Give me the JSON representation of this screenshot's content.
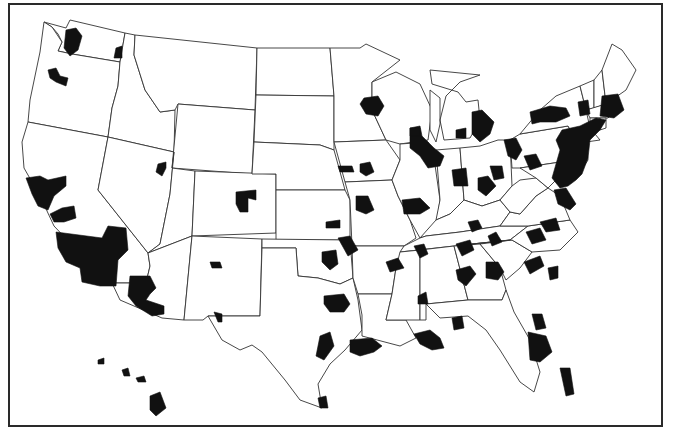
{
  "map": {
    "subject": "Contiguous United States, Alaska excluded, Hawaii inset, with shaded metropolitan areas",
    "colors": {
      "background": "#ffffff",
      "state_fill": "#ffffff",
      "state_border": "#333333",
      "metro_fill": "#111111",
      "frame": "#2a2a2a"
    },
    "legend": null,
    "title": null,
    "states": [
      {
        "id": "WA",
        "d": "M44,22 L52,27 L58,34 L62,42 L58,51 L72,54 L120,62 L125,33 L70,20 L66,28 Z"
      },
      {
        "id": "OR",
        "d": "M44,22 L40,52 L30,100 L28,122 L108,137 L112,108 L118,86 L120,62 L72,54 L58,51 L62,42 L52,27 Z"
      },
      {
        "id": "CA",
        "d": "M28,122 L108,137 L98,190 L148,253 L150,266 L146,283 L112,283 L96,262 L74,247 L54,226 L40,196 L24,168 L22,142 Z"
      },
      {
        "id": "ID",
        "d": "M125,33 L135,35 L134,55 L145,90 L160,112 L175,110 L174,152 L108,137 L112,108 L118,86 L120,62 Z"
      },
      {
        "id": "NV",
        "d": "M108,137 L174,152 L170,194 L160,244 L148,253 L98,190 Z"
      },
      {
        "id": "MT",
        "d": "M135,35 L257,48 L255,110 L178,104 L175,110 L160,112 L145,90 L134,55 Z"
      },
      {
        "id": "WY",
        "d": "M178,104 L255,110 L252,174 L172,168 Z"
      },
      {
        "id": "UT",
        "d": "M174,152 L172,168 L195,171 L192,236 L148,253 L160,244 L170,194 Z"
      },
      {
        "id": "AZ",
        "d": "M148,253 L192,236 L184,320 L162,318 L120,300 L112,283 L146,283 L150,266 Z"
      },
      {
        "id": "CO",
        "d": "M195,171 L276,174 L276,233 L192,236 Z"
      },
      {
        "id": "NM",
        "d": "M192,236 L262,239 L260,316 L208,316 L203,320 L184,320 Z"
      },
      {
        "id": "ND",
        "d": "M257,48 L330,48 L334,96 L256,95 Z"
      },
      {
        "id": "SD",
        "d": "M256,95 L334,96 L334,150 L320,145 L254,142 Z"
      },
      {
        "id": "NE",
        "d": "M254,142 L320,145 L334,150 L345,190 L276,190 L276,174 L252,174 Z"
      },
      {
        "id": "KS",
        "d": "M276,190 L345,190 L350,200 L350,240 L276,240 Z"
      },
      {
        "id": "OK",
        "d": "M262,239 L350,240 L353,278 L340,284 L318,278 L298,276 L296,248 L262,248 Z"
      },
      {
        "id": "TX",
        "d": "M262,248 L296,248 L298,276 L318,278 L340,284 L353,278 L358,300 L362,330 L345,350 L330,364 L318,384 L322,408 L300,400 L285,380 L262,352 L252,345 L240,350 L222,340 L208,316 L260,316 Z"
      },
      {
        "id": "MN",
        "d": "M330,48 L360,48 L366,44 L400,60 L372,82 L372,110 L386,140 L334,142 L334,96 Z"
      },
      {
        "id": "IA",
        "d": "M334,142 L386,140 L400,160 L392,180 L345,182 Z"
      },
      {
        "id": "MO",
        "d": "M345,182 L392,180 L398,196 L410,220 L416,238 L404,246 L352,246 L350,200 Z"
      },
      {
        "id": "AR",
        "d": "M352,246 L404,246 L396,268 L392,294 L358,294 L353,278 Z"
      },
      {
        "id": "LA",
        "d": "M358,294 L392,294 L386,320 L406,320 L416,338 L400,346 L362,336 L362,315 Z"
      },
      {
        "id": "WI",
        "d": "M372,82 L396,72 L420,84 L432,110 L428,140 L400,144 L386,140 L372,110 Z"
      },
      {
        "id": "IL",
        "d": "M400,144 L428,142 L434,158 L440,200 L436,228 L420,238 L410,220 L398,196 L392,180 L400,160 Z"
      },
      {
        "id": "MI",
        "d": "M430,70 L480,75 L460,82 L446,96 L440,120 L444,140 L470,138 L480,120 L478,100 L466,102 L458,92 L432,84 Z M430,90 L440,98 L440,124 L436,142 L430,130 Z"
      },
      {
        "id": "IN",
        "d": "M436,150 L460,148 L464,200 L450,214 L436,220 L440,200 Z"
      },
      {
        "id": "OH",
        "d": "M460,148 L480,146 L498,140 L510,140 L512,186 L500,200 L482,206 L464,200 Z"
      },
      {
        "id": "KY",
        "d": "M420,238 L436,220 L450,214 L464,200 L482,206 L500,200 L510,212 L500,226 L460,232 L426,236 Z"
      },
      {
        "id": "TN",
        "d": "M404,246 L420,238 L426,236 L460,232 L500,226 L528,226 L510,240 L472,244 L400,252 Z"
      },
      {
        "id": "MS",
        "d": "M400,252 L420,250 L420,320 L406,320 L386,320 L392,294 L396,268 Z"
      },
      {
        "id": "AL",
        "d": "M420,250 L454,246 L468,300 L426,304 L426,320 L420,320 Z"
      },
      {
        "id": "GA",
        "d": "M454,246 L480,244 L500,268 L506,290 L502,300 L468,300 Z"
      },
      {
        "id": "FL",
        "d": "M426,304 L468,300 L502,300 L506,290 L514,312 L530,340 L540,372 L534,392 L520,382 L500,350 L486,330 L468,316 L440,318 Z"
      },
      {
        "id": "SC",
        "d": "M480,244 L512,240 L532,252 L520,268 L506,280 L500,268 Z"
      },
      {
        "id": "NC",
        "d": "M472,244 L510,240 L528,226 L570,220 L578,232 L560,250 L532,252 L512,240 Z"
      },
      {
        "id": "VA",
        "d": "M500,226 L510,212 L520,214 L536,196 L548,188 L560,196 L570,220 L528,226 Z"
      },
      {
        "id": "WV",
        "d": "M512,186 L520,180 L536,178 L548,188 L536,196 L520,214 L510,212 L500,200 Z"
      },
      {
        "id": "PA",
        "d": "M510,140 L520,134 L568,126 L576,140 L574,160 L520,168 L512,168 Z"
      },
      {
        "id": "NY",
        "d": "M520,134 L540,110 L556,96 L580,86 L586,110 L590,128 L600,140 L586,142 L576,140 L568,126 Z"
      },
      {
        "id": "NJ",
        "d": "M576,140 L586,142 L588,160 L580,172 L574,160 Z"
      },
      {
        "id": "MD",
        "d": "M520,168 L574,160 L580,172 L572,178 L560,176 L548,188 L536,178 Z"
      },
      {
        "id": "DE",
        "d": "M574,160 L580,172 L576,176 L572,178 Z"
      },
      {
        "id": "VT",
        "d": "M580,86 L594,80 L594,108 L586,110 Z"
      },
      {
        "id": "NH",
        "d": "M594,80 L602,70 L606,104 L594,108 Z"
      },
      {
        "id": "ME",
        "d": "M602,70 L612,44 L622,50 L636,70 L626,90 L606,104 Z"
      },
      {
        "id": "MA",
        "d": "M586,110 L606,104 L618,108 L608,118 L590,118 Z"
      },
      {
        "id": "CT",
        "d": "M590,118 L600,118 L600,130 L590,128 Z"
      },
      {
        "id": "RI",
        "d": "M600,118 L606,118 L606,128 L600,130 Z"
      }
    ],
    "hawaii": [
      {
        "d": "M98,360 L104,358 L104,364 L98,364 Z"
      },
      {
        "d": "M122,370 L128,368 L130,376 L124,376 Z"
      },
      {
        "d": "M136,378 L144,376 L146,382 L138,382 Z"
      },
      {
        "d": "M150,396 L160,392 L166,408 L156,416 L150,410 Z"
      }
    ],
    "metros": [
      {
        "name": "Seattle",
        "d": "M66,30 L76,28 L82,36 L78,50 L70,56 L64,48 Z"
      },
      {
        "name": "Spokane",
        "d": "M116,48 L122,46 L122,58 L114,58 Z"
      },
      {
        "name": "Portland",
        "d": "M48,70 L56,68 L60,76 L68,78 L66,86 L56,82 L50,78 Z"
      },
      {
        "name": "San Francisco Bay",
        "d": "M26,178 L40,176 L48,180 L66,176 L66,186 L54,196 L48,210 L38,206 L32,194 Z"
      },
      {
        "name": "Fresno",
        "d": "M50,214 L62,208 L74,206 L76,218 L64,222 L54,222 Z"
      },
      {
        "name": "Los Angeles-Riverside",
        "d": "M56,232 L102,238 L108,226 L126,228 L128,250 L118,260 L116,286 L100,286 L82,282 L80,268 L66,262 L58,248 Z"
      },
      {
        "name": "Phoenix-Tucson",
        "d": "M130,276 L150,276 L156,288 L150,294 L146,300 L164,306 L164,314 L152,316 L136,306 L128,296 Z"
      },
      {
        "name": "Salt Lake City",
        "d": "M158,164 L166,162 L166,168 L162,176 L156,172 Z"
      },
      {
        "name": "Denver",
        "d": "M236,192 L256,190 L256,200 L248,198 L248,212 L240,212 L236,204 Z"
      },
      {
        "name": "Albuquerque",
        "d": "M210,262 L220,262 L222,268 L212,268 Z"
      },
      {
        "name": "El Paso",
        "d": "M214,312 L222,314 L222,322 L218,322 Z"
      },
      {
        "name": "Minneapolis",
        "d": "M364,98 L378,96 L384,106 L378,116 L366,114 L360,104 Z"
      },
      {
        "name": "Des Moines",
        "d": "M360,164 L370,162 L374,172 L366,176 L360,172 Z"
      },
      {
        "name": "Omaha",
        "d": "M338,166 L352,166 L354,172 L340,172 Z"
      },
      {
        "name": "Kansas City",
        "d": "M356,196 L368,196 L374,210 L366,214 L356,210 Z"
      },
      {
        "name": "St. Louis",
        "d": "M402,200 L420,198 L430,208 L420,214 L404,214 Z"
      },
      {
        "name": "Wichita",
        "d": "M326,222 L340,220 L340,228 L326,228 Z"
      },
      {
        "name": "Tulsa",
        "d": "M338,238 L350,236 L358,250 L348,256 Z"
      },
      {
        "name": "Oklahoma City",
        "d": "M322,252 L336,250 L338,264 L330,270 L322,262 Z"
      },
      {
        "name": "Dallas-Fort Worth",
        "d": "M324,296 L344,294 L350,304 L344,312 L330,312 L324,304 Z"
      },
      {
        "name": "Austin-San Antonio",
        "d": "M320,336 L330,332 L334,346 L324,360 L316,356 Z"
      },
      {
        "name": "Houston",
        "d": "M350,340 L372,338 L382,346 L374,352 L360,356 L350,352 Z"
      },
      {
        "name": "Corpus Christi-Brownsville",
        "d": "M318,398 L326,396 L328,408 L320,408 Z"
      },
      {
        "name": "Little Rock",
        "d": "M386,262 L398,258 L404,268 L390,272 Z"
      },
      {
        "name": "Memphis",
        "d": "M414,246 L424,244 L428,254 L420,258 Z"
      },
      {
        "name": "Jackson",
        "d": "M418,296 L426,292 L428,304 L418,304 Z"
      },
      {
        "name": "New Orleans-Baton Rouge",
        "d": "M414,334 L430,330 L440,338 L444,348 L432,350 L420,344 Z"
      },
      {
        "name": "Birmingham",
        "d": "M456,270 L470,266 L476,274 L466,286 L458,280 Z"
      },
      {
        "name": "Mobile",
        "d": "M452,318 L462,316 L464,328 L454,330 Z"
      },
      {
        "name": "Atlanta",
        "d": "M486,262 L498,262 L504,272 L498,280 L486,278 Z"
      },
      {
        "name": "Columbia",
        "d": "M524,262 L540,256 L544,266 L530,274 Z"
      },
      {
        "name": "Charleston",
        "d": "M548,268 L558,266 L558,278 L550,280 Z"
      },
      {
        "name": "Nashville",
        "d": "M456,244 L470,240 L474,250 L462,256 Z"
      },
      {
        "name": "Knoxville",
        "d": "M488,236 L496,232 L502,242 L492,246 Z"
      },
      {
        "name": "Charlotte",
        "d": "M526,232 L540,228 L546,240 L532,244 Z"
      },
      {
        "name": "Greensboro-Raleigh",
        "d": "M540,222 L556,218 L560,230 L546,232 Z"
      },
      {
        "name": "Richmond-Norfolk",
        "d": "M554,190 L566,188 L576,204 L570,210 L558,204 Z"
      },
      {
        "name": "Jacksonville",
        "d": "M532,314 L542,314 L546,328 L536,330 Z"
      },
      {
        "name": "Orlando-Tampa",
        "d": "M528,332 L546,336 L552,352 L540,362 L530,360 Z"
      },
      {
        "name": "Miami",
        "d": "M560,368 L570,368 L574,394 L566,396 Z"
      },
      {
        "name": "Louisville",
        "d": "M468,222 L478,220 L482,228 L472,232 Z"
      },
      {
        "name": "Indianapolis",
        "d": "M452,170 L466,168 L468,186 L454,186 Z"
      },
      {
        "name": "Cincinnati-Dayton",
        "d": "M478,178 L488,176 L496,186 L486,196 L478,190 Z"
      },
      {
        "name": "Columbus",
        "d": "M490,166 L502,166 L504,178 L494,180 Z"
      },
      {
        "name": "Chicago-Milwaukee",
        "d": "M410,128 L420,126 L422,136 L434,148 L444,156 L440,166 L428,168 L420,156 L410,148 Z"
      },
      {
        "name": "Madison",
        "d": "M410,128 L420,128 L420,136 L410,136 Z"
      },
      {
        "name": "Grand Rapids",
        "d": "M456,130 L466,128 L466,138 L456,138 Z"
      },
      {
        "name": "Detroit",
        "d": "M472,112 L482,110 L494,122 L490,134 L480,142 L472,134 Z"
      },
      {
        "name": "Cleveland-Pittsburgh",
        "d": "M504,140 L516,138 L522,150 L516,160 L508,156 Z M524,156 L536,154 L542,166 L530,170 Z"
      },
      {
        "name": "Buffalo-Rochester-Syracuse",
        "d": "M530,112 L550,106 L566,108 L570,116 L556,122 L540,122 L532,124 Z"
      },
      {
        "name": "Albany",
        "d": "M578,102 L588,100 L590,114 L580,116 Z"
      },
      {
        "name": "Boston-Providence",
        "d": "M602,96 L618,94 L624,110 L614,118 L600,116 Z"
      },
      {
        "name": "Northeast Corridor (NYC-Philadelphia-Baltimore-Washington)",
        "d": "M562,130 L580,126 L596,118 L606,120 L600,130 L590,140 L588,158 L582,174 L576,180 L568,186 L560,188 L552,178 L556,164 L560,150 L556,140 Z"
      }
    ]
  }
}
